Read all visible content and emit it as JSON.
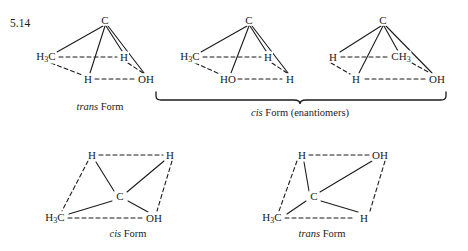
{
  "problem_number": "5.14",
  "structures": [
    {
      "id": "structure-1-trans-top",
      "caption_italic": "trans",
      "caption_rest": " Form",
      "caption_x": 100,
      "caption_y": 101,
      "type": "tetrahedral-projection",
      "apex": {
        "label": "C",
        "x": 105,
        "y": 20
      },
      "atoms": [
        {
          "label": "H",
          "sub": "3",
          "after": "C",
          "x": 46,
          "y": 57,
          "name": "atom-methyl-left"
        },
        {
          "label": "H",
          "x": 124,
          "y": 57,
          "name": "atom-h-right"
        },
        {
          "label": "H",
          "x": 88,
          "y": 79,
          "name": "atom-h-front"
        },
        {
          "label": "OH",
          "x": 146,
          "y": 79,
          "name": "atom-oh-front-right"
        }
      ]
    },
    {
      "id": "structure-2-cis-top",
      "type": "tetrahedral-projection",
      "apex": {
        "label": "C",
        "x": 249,
        "y": 20
      },
      "atoms": [
        {
          "label": "H",
          "sub": "3",
          "after": "C",
          "x": 190,
          "y": 57,
          "name": "atom-methyl-left"
        },
        {
          "label": "H",
          "x": 268,
          "y": 57,
          "name": "atom-h-right"
        },
        {
          "label": "HO",
          "x": 228,
          "y": 79,
          "name": "atom-ho-front"
        },
        {
          "label": "H",
          "x": 290,
          "y": 79,
          "name": "atom-h-front-right"
        }
      ]
    },
    {
      "id": "structure-3-cis-top",
      "type": "tetrahedral-projection",
      "apex": {
        "label": "C",
        "x": 383,
        "y": 20
      },
      "atoms": [
        {
          "label": "H",
          "x": 333,
          "y": 57,
          "name": "atom-h-left"
        },
        {
          "label": "CH",
          "sub": "3",
          "after": "",
          "x": 401,
          "y": 57,
          "name": "atom-methyl-right"
        },
        {
          "label": "H",
          "x": 356,
          "y": 79,
          "name": "atom-h-front"
        },
        {
          "label": "OH",
          "x": 437,
          "y": 79,
          "name": "atom-oh-front-right"
        }
      ]
    },
    {
      "id": "structure-4-cis-bottom",
      "caption_italic": "cis",
      "caption_rest": " Form",
      "caption_x": 128,
      "caption_y": 232,
      "type": "parallelogram-projection",
      "center": {
        "label": "C",
        "x": 120,
        "y": 196
      },
      "atoms": [
        {
          "label": "H",
          "x": 92,
          "y": 155,
          "name": "atom-h-top-left"
        },
        {
          "label": "H",
          "x": 170,
          "y": 155,
          "name": "atom-h-top-right"
        },
        {
          "label": "H",
          "sub": "3",
          "after": "C",
          "x": 55,
          "y": 218,
          "name": "atom-methyl-bottom-left"
        },
        {
          "label": "OH",
          "x": 154,
          "y": 218,
          "name": "atom-oh-bottom-right"
        }
      ]
    },
    {
      "id": "structure-5-trans-bottom",
      "caption_italic": "trans",
      "caption_rest": " Form",
      "caption_x": 322,
      "caption_y": 232,
      "type": "parallelogram-projection",
      "center": {
        "label": "C",
        "x": 314,
        "y": 196
      },
      "atoms": [
        {
          "label": "H",
          "x": 302,
          "y": 155,
          "name": "atom-h-top-left"
        },
        {
          "label": "OH",
          "x": 380,
          "y": 155,
          "name": "atom-oh-top-right"
        },
        {
          "label": "H",
          "sub": "3",
          "after": "C",
          "x": 272,
          "y": 218,
          "name": "atom-methyl-bottom-left"
        },
        {
          "label": "H",
          "x": 364,
          "y": 218,
          "name": "atom-h-bottom-right"
        }
      ]
    }
  ],
  "brace": {
    "label_italic": "cis",
    "label_rest": " Form (enantiomers)",
    "label_x": 300,
    "label_y": 112,
    "left_x": 156,
    "right_x": 446,
    "top_y": 92,
    "tip_x": 300,
    "tip_y": 104
  },
  "colors": {
    "ink": "#1b1b1b",
    "background": "#ffffff"
  }
}
